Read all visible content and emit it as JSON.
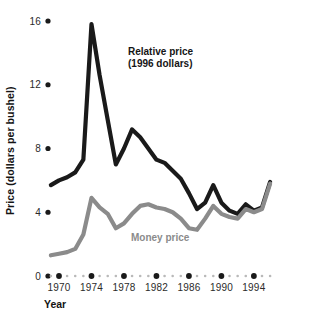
{
  "chart_data": {
    "type": "line",
    "title": "",
    "xlabel": "Year",
    "ylabel": "Price (dollars per bushel)",
    "xlim": [
      1969,
      1996
    ],
    "ylim": [
      0,
      16
    ],
    "grid": false,
    "legend_position": "inline-annotations",
    "x": [
      1969,
      1970,
      1971,
      1972,
      1973,
      1974,
      1975,
      1976,
      1977,
      1978,
      1979,
      1980,
      1981,
      1982,
      1983,
      1984,
      1985,
      1986,
      1987,
      1988,
      1989,
      1990,
      1991,
      1992,
      1993,
      1994,
      1995,
      1996
    ],
    "xticks": [
      1970,
      1974,
      1978,
      1982,
      1986,
      1990,
      1994
    ],
    "xticklabels": [
      "1970",
      "1974",
      "1978",
      "1982",
      "1986",
      "1990",
      "1994"
    ],
    "yticks": [
      0,
      4,
      8,
      12,
      16
    ],
    "yticklabels": [
      "0",
      "4",
      "8",
      "12",
      "16"
    ],
    "series": [
      {
        "name": "Relative price (1996 dollars)",
        "color": "#1a1a1a",
        "values": [
          5.7,
          6.0,
          6.2,
          6.5,
          7.3,
          15.8,
          12.6,
          9.8,
          7.0,
          8.0,
          9.2,
          8.7,
          8.0,
          7.3,
          7.1,
          6.6,
          6.1,
          5.2,
          4.2,
          4.6,
          5.7,
          4.6,
          4.1,
          3.9,
          4.5,
          4.1,
          4.3,
          5.9
        ]
      },
      {
        "name": "Money price",
        "color": "#8b8b8b",
        "values": [
          1.3,
          1.4,
          1.5,
          1.7,
          2.6,
          4.9,
          4.3,
          3.9,
          3.0,
          3.3,
          3.9,
          4.4,
          4.5,
          4.3,
          4.2,
          4.0,
          3.6,
          3.0,
          2.9,
          3.6,
          4.4,
          3.9,
          3.7,
          3.6,
          4.2,
          4.0,
          4.2,
          5.8
        ]
      }
    ],
    "annotations": [
      {
        "id": "relative-price-label",
        "line1": "Relative price",
        "line2": "(1996 dollars)",
        "color": "#151515",
        "x": 128,
        "y": 55
      },
      {
        "id": "money-price-label",
        "text": "Money price",
        "color": "#8b8b8b",
        "x": 131,
        "y": 241
      }
    ]
  },
  "axes": {
    "y_axis_title": "Price (dollars per bushel)",
    "x_axis_title": "Year"
  }
}
